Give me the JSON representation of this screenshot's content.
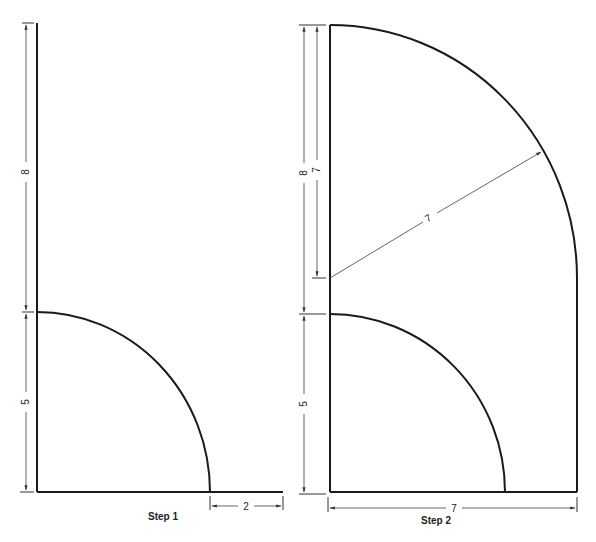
{
  "figures": [
    {
      "caption": "Step 1",
      "dimensions": {
        "upper_vertical": "8",
        "lower_vertical": "5",
        "bottom_extension": "2"
      }
    },
    {
      "caption": "Step 2",
      "dimensions": {
        "outer_vertical": "8",
        "inner_vertical": "7",
        "lower_vertical": "5",
        "bottom_width": "7",
        "diagonal_radius": "7"
      }
    }
  ]
}
